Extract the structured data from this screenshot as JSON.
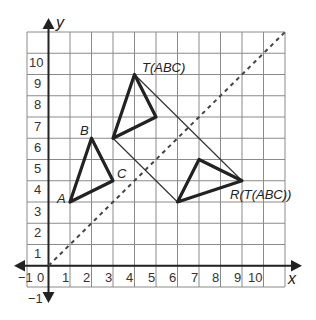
{
  "diagram": {
    "type": "coordinate-plane-transformations",
    "axes": {
      "x_label": "x",
      "y_label": "y",
      "x_ticks": [
        "1",
        "2",
        "3",
        "4",
        "5",
        "6",
        "7",
        "8",
        "9",
        "10"
      ],
      "y_ticks": [
        "10",
        "9",
        "8",
        "7",
        "6",
        "5",
        "4",
        "3",
        "2",
        "1"
      ],
      "origin_label_left": "−1",
      "origin_label": "0",
      "neg_y_label": "−1",
      "range": {
        "xmin": -1,
        "xmax": 11,
        "ymin": -1,
        "ymax": 11
      }
    },
    "figures": {
      "original": {
        "name": "ABC",
        "vertices": {
          "A": [
            1,
            3
          ],
          "B": [
            2,
            6
          ],
          "C": [
            3,
            4
          ]
        },
        "labels": {
          "A": "A",
          "B": "B",
          "C": "C"
        }
      },
      "translated": {
        "label": "T(ABC)",
        "vertices": [
          [
            3,
            6
          ],
          [
            4,
            9
          ],
          [
            5,
            7
          ]
        ]
      },
      "reflected": {
        "label": "R(T(ABC))",
        "vertices": [
          [
            6,
            3
          ],
          [
            9,
            4
          ],
          [
            7,
            5
          ]
        ]
      }
    },
    "reflection_line": {
      "equation": "y = x",
      "style": "dashed",
      "from": [
        0,
        0
      ],
      "to": [
        11,
        11
      ]
    },
    "connectors": [
      {
        "from": [
          4,
          9
        ],
        "to": [
          9,
          4
        ]
      },
      {
        "from": [
          3,
          6
        ],
        "to": [
          6,
          3
        ]
      }
    ]
  }
}
